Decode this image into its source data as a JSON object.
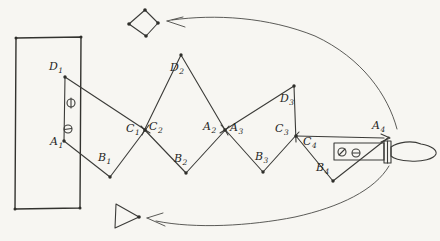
{
  "colors": {
    "paper": "#f7f6f2",
    "ink": "#3b3b38",
    "label_text": "#26261f"
  },
  "labels": {
    "D1": {
      "base": "D",
      "sub": "1"
    },
    "A1": {
      "base": "A",
      "sub": "1"
    },
    "B1": {
      "base": "B",
      "sub": "1"
    },
    "C1": {
      "base": "C",
      "sub": "1"
    },
    "C2": {
      "base": "C",
      "sub": "2"
    },
    "D2": {
      "base": "D",
      "sub": "2"
    },
    "B2": {
      "base": "B",
      "sub": "2"
    },
    "A2": {
      "base": "A",
      "sub": "2"
    },
    "A3": {
      "base": "A",
      "sub": "3"
    },
    "D3": {
      "base": "D",
      "sub": "3"
    },
    "C3": {
      "base": "C",
      "sub": "3"
    },
    "C4": {
      "base": "C",
      "sub": "4"
    },
    "B3": {
      "base": "B",
      "sub": "3"
    },
    "B4": {
      "base": "B",
      "sub": "4"
    },
    "A4": {
      "base": "A",
      "sub": "4"
    }
  },
  "components": {
    "backing_plate": "rectangular-plate",
    "panels": [
      "panel-1",
      "panel-2",
      "panel-3",
      "panel-4"
    ],
    "markers": [
      "diamond-marker",
      "triangle-marker"
    ],
    "arrows": [
      "rotation-arrow-top",
      "rotation-arrow-bottom",
      "a4-direction-arrow"
    ],
    "crank": [
      "crank-shaft",
      "crank-collar",
      "crank-handle-grip"
    ],
    "screws": [
      "phi-screw-icon",
      "slot-screw-icon",
      "slash-screw-icon",
      "minus-screw-icon"
    ]
  }
}
